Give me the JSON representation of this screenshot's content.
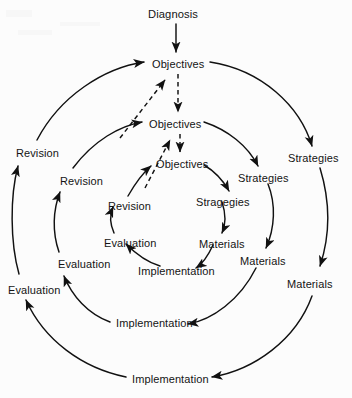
{
  "diagram": {
    "title": "Diagnosis",
    "type": "concentric-cycle",
    "entry": {
      "label": "Diagnosis",
      "x": 148,
      "y": 8
    },
    "rings": [
      {
        "name": "outer-ring",
        "nodes": [
          {
            "role": "objectives",
            "label": "Objectives",
            "x": 152,
            "y": 58
          },
          {
            "role": "strategies",
            "label": "Strategies",
            "x": 288,
            "y": 152
          },
          {
            "role": "materials",
            "label": "Materials",
            "x": 287,
            "y": 278
          },
          {
            "role": "implementation",
            "label": "Implementation",
            "x": 132,
            "y": 373
          },
          {
            "role": "evaluation",
            "label": "Evaluation",
            "x": 8,
            "y": 284
          },
          {
            "role": "revision",
            "label": "Revision",
            "x": 16,
            "y": 147
          }
        ]
      },
      {
        "name": "middle-ring",
        "nodes": [
          {
            "role": "objectives",
            "label": "Objectives",
            "x": 149,
            "y": 118
          },
          {
            "role": "strategies",
            "label": "Strategies",
            "x": 238,
            "y": 172
          },
          {
            "role": "materials",
            "label": "Materials",
            "x": 240,
            "y": 255
          },
          {
            "role": "implementation",
            "label": "Implementation",
            "x": 116,
            "y": 317
          },
          {
            "role": "evaluation",
            "label": "Evaluation",
            "x": 58,
            "y": 258
          },
          {
            "role": "revision",
            "label": "Revision",
            "x": 60,
            "y": 175
          }
        ]
      },
      {
        "name": "inner-ring",
        "nodes": [
          {
            "role": "objectives",
            "label": "Objectives",
            "x": 156,
            "y": 158
          },
          {
            "role": "strategies",
            "label": "Stragegies",
            "x": 196,
            "y": 196
          },
          {
            "role": "materials",
            "label": "Materials",
            "x": 199,
            "y": 238
          },
          {
            "role": "implementation",
            "label": "Implementation",
            "x": 138,
            "y": 265
          },
          {
            "role": "evaluation",
            "label": "Evaluation",
            "x": 104,
            "y": 237
          },
          {
            "role": "revision",
            "label": "Revision",
            "x": 108,
            "y": 200
          }
        ]
      }
    ],
    "colors": {
      "ink": "#111111",
      "background": "#fcfcfc"
    }
  }
}
